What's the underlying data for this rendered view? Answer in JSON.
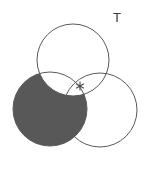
{
  "figure": {
    "type": "venn-diagram",
    "set_count": 3,
    "background_color": "#ffffff",
    "outline_color": "#5a5a5a",
    "outline_width": 1,
    "shade_color": "#585858",
    "label_color": "#3c3c3c",
    "marker_color": "#4a4a4a"
  },
  "universe": {
    "label": "T",
    "x": 113,
    "y": 11
  },
  "circles": [
    {
      "id": "top",
      "name": "circle-top",
      "cx": 73,
      "cy": 60,
      "r": 36,
      "filled": false
    },
    {
      "id": "left",
      "name": "circle-left",
      "cx": 50,
      "cy": 109,
      "r": 37,
      "filled": true
    },
    {
      "id": "right",
      "name": "circle-right",
      "cx": 100,
      "cy": 110,
      "r": 37,
      "filled": false
    }
  ],
  "shaded_region": {
    "description": "left-minus-top",
    "include": "left",
    "exclude": "top",
    "color": "#585858"
  },
  "marker": {
    "glyph": "✳",
    "symbol": "asterisk",
    "x": 80,
    "y": 86,
    "size": 9
  }
}
